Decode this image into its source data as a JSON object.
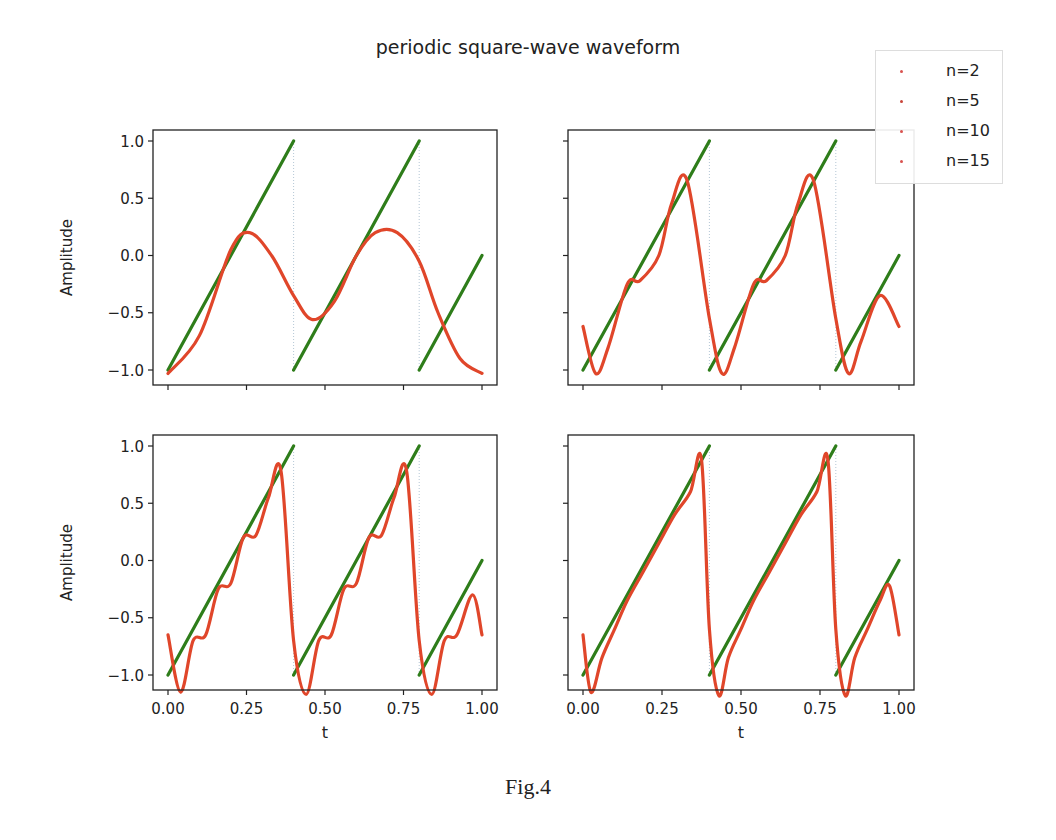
{
  "figure": {
    "title": "periodic square-wave waveform",
    "caption": "Fig.4"
  },
  "legend": {
    "position": "upper right (outside figure)",
    "items": [
      {
        "label": "n=2",
        "color": "#d9534f"
      },
      {
        "label": "n=5",
        "color": "#c9453a"
      },
      {
        "label": "n=10",
        "color": "#d9534f"
      },
      {
        "label": "n=15",
        "color": "#d9534f"
      }
    ]
  },
  "colors": {
    "sawtooth": "#2e7d1a",
    "fourier": "#e0462a",
    "axes": "#222222"
  },
  "chart_data": {
    "type": "line",
    "title": "periodic square-wave waveform",
    "layout": "2x2 subplots, shared x and y axes",
    "xlabel": "t",
    "ylabel": "Amplitude",
    "xlim": [
      -0.03,
      1.03
    ],
    "ylim": [
      -1.15,
      1.1
    ],
    "x_ticks": [
      "0.00",
      "0.25",
      "0.50",
      "0.75",
      "1.00"
    ],
    "y_ticks": [
      "1.0",
      "0.5",
      "0.0",
      "−0.5",
      "−1.0"
    ],
    "grid": false,
    "subplots": [
      {
        "position": "top-left",
        "harmonics": 2,
        "series": [
          {
            "name": "sawtooth (period 0.4)",
            "x": [
              0,
              0.4,
              0.4,
              0.8,
              0.8,
              1.0
            ],
            "y": [
              -1,
              1,
              -1,
              1,
              -1,
              0
            ]
          },
          {
            "name": "n=2",
            "x": [
              0,
              0.1,
              0.2,
              0.26,
              0.33,
              0.4,
              0.46,
              0.53,
              0.6,
              0.66,
              0.73,
              0.8,
              0.86,
              0.93,
              1.0
            ],
            "y": [
              -1.03,
              -0.7,
              0.05,
              0.2,
              0.0,
              -0.35,
              -0.56,
              -0.4,
              0.0,
              0.2,
              0.2,
              -0.05,
              -0.5,
              -0.9,
              -1.03
            ]
          }
        ]
      },
      {
        "position": "top-right",
        "harmonics": 5,
        "series": [
          {
            "name": "sawtooth (period 0.4)",
            "x": [
              0,
              0.4,
              0.4,
              0.8,
              0.8,
              1.0
            ],
            "y": [
              -1,
              1,
              -1,
              1,
              -1,
              0
            ]
          },
          {
            "name": "n=5",
            "x": [
              0,
              0.04,
              0.08,
              0.14,
              0.18,
              0.24,
              0.28,
              0.33,
              0.4,
              0.44,
              0.48,
              0.54,
              0.58,
              0.64,
              0.68,
              0.73,
              0.8,
              0.84,
              0.88,
              0.94,
              1.0
            ],
            "y": [
              -0.62,
              -1.03,
              -0.8,
              -0.25,
              -0.22,
              0.0,
              0.45,
              0.65,
              -0.55,
              -1.03,
              -0.8,
              -0.25,
              -0.22,
              0.0,
              0.45,
              0.65,
              -0.55,
              -1.03,
              -0.75,
              -0.35,
              -0.62
            ]
          }
        ]
      },
      {
        "position": "bottom-left",
        "harmonics": 10,
        "series": [
          {
            "name": "sawtooth (period 0.4)",
            "x": [
              0,
              0.4,
              0.4,
              0.8,
              0.8,
              1.0
            ],
            "y": [
              -1,
              1,
              -1,
              1,
              -1,
              0
            ]
          },
          {
            "name": "n=10",
            "x": [
              0,
              0.04,
              0.08,
              0.12,
              0.16,
              0.2,
              0.24,
              0.28,
              0.32,
              0.36,
              0.4,
              0.44,
              0.48,
              0.52,
              0.56,
              0.6,
              0.64,
              0.68,
              0.72,
              0.76,
              0.8,
              0.84,
              0.88,
              0.92,
              0.97,
              1.0
            ],
            "y": [
              -0.65,
              -1.15,
              -0.7,
              -0.65,
              -0.25,
              -0.2,
              0.2,
              0.22,
              0.55,
              0.78,
              -0.7,
              -1.17,
              -0.7,
              -0.65,
              -0.25,
              -0.2,
              0.2,
              0.22,
              0.55,
              0.78,
              -0.7,
              -1.17,
              -0.7,
              -0.65,
              -0.3,
              -0.65
            ]
          }
        ]
      },
      {
        "position": "bottom-right",
        "harmonics": 15,
        "series": [
          {
            "name": "sawtooth (period 0.4)",
            "x": [
              0,
              0.4,
              0.4,
              0.8,
              0.8,
              1.0
            ],
            "y": [
              -1,
              1,
              -1,
              1,
              -1,
              0
            ]
          },
          {
            "name": "n=15",
            "x": [
              0,
              0.025,
              0.06,
              0.1,
              0.14,
              0.19,
              0.24,
              0.29,
              0.34,
              0.375,
              0.4,
              0.43,
              0.46,
              0.5,
              0.54,
              0.59,
              0.64,
              0.69,
              0.74,
              0.775,
              0.8,
              0.83,
              0.86,
              0.9,
              0.94,
              0.97,
              1.0
            ],
            "y": [
              -0.65,
              -1.15,
              -0.85,
              -0.6,
              -0.35,
              -0.1,
              0.15,
              0.4,
              0.6,
              0.88,
              -0.6,
              -1.18,
              -0.85,
              -0.6,
              -0.35,
              -0.1,
              0.15,
              0.4,
              0.6,
              0.88,
              -0.6,
              -1.18,
              -0.85,
              -0.6,
              -0.35,
              -0.22,
              -0.65
            ]
          }
        ]
      }
    ]
  }
}
